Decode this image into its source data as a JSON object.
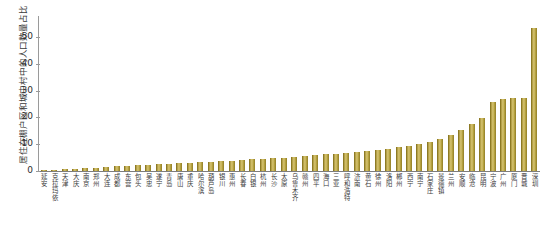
{
  "chart_data": {
    "type": "bar",
    "title": "",
    "xlabel": "",
    "ylabel": "居住在棚户区和城中村中的人口数量占比（%）",
    "ylim": [
      0,
      55
    ],
    "yticks": [
      0,
      10,
      20,
      30,
      40,
      50
    ],
    "ytick_labels": [
      "0",
      "10",
      "20",
      "30",
      "40",
      "50"
    ],
    "grid": false,
    "legend": "none",
    "bar_color": "#a8922f",
    "categories": [
      "延安",
      "克拉玛依",
      "天津",
      "大庆",
      "南京",
      "郑州",
      "大连",
      "成都",
      "东营",
      "包头",
      "吴忠",
      "遂宁",
      "青岛",
      "唐山",
      "重庆",
      "哈尔滨",
      "葫芦岛",
      "银川",
      "惠州",
      "长春",
      "白银",
      "杭州",
      "长沙",
      "太原",
      "乌鲁木齐",
      "赣州",
      "四平",
      "海口",
      "三亚",
      "呼和浩特",
      "济南",
      "黄石",
      "徐州",
      "洛阳",
      "郴州",
      "西宁",
      "南宁",
      "石家庄",
      "景德镇",
      "兰州",
      "安顺",
      "临沧",
      "昆明",
      "宁波",
      "广州",
      "厦门",
      "晋城",
      "深圳"
    ],
    "values": [
      0.3,
      0.5,
      0.7,
      0.9,
      1.1,
      1.3,
      1.5,
      1.7,
      1.9,
      2.1,
      2.3,
      2.5,
      2.7,
      2.9,
      3.1,
      3.3,
      3.5,
      3.7,
      3.9,
      4.1,
      4.3,
      4.6,
      4.8,
      5.0,
      5.3,
      5.6,
      5.9,
      6.2,
      6.5,
      6.8,
      7.1,
      7.5,
      7.9,
      8.4,
      8.9,
      9.5,
      10.2,
      11.0,
      12.0,
      13.4,
      15.4,
      17.6,
      19.8,
      25.8,
      26.8,
      27.2,
      27.4,
      53.2
    ]
  }
}
